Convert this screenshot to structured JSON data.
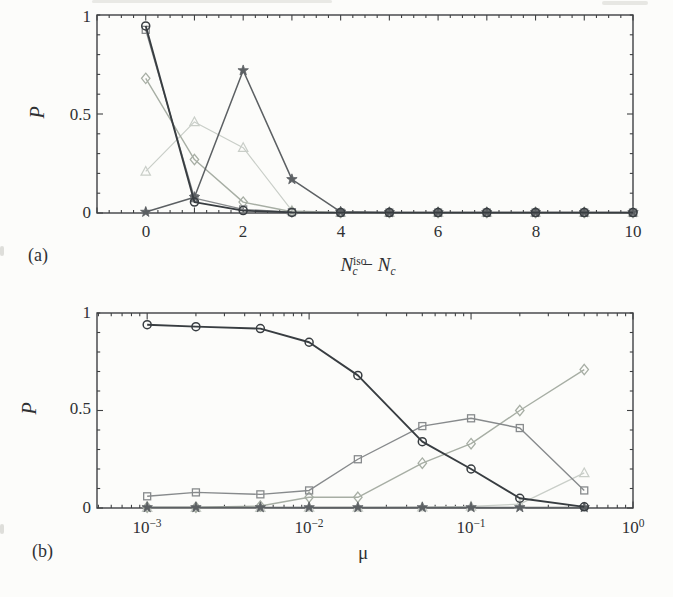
{
  "figure": {
    "background": "#fcfcfa",
    "axis_color": "#3f4143",
    "text_color": "#2f3133",
    "panels": [
      {
        "label": "(a)",
        "ylabel": "P",
        "yticks": [
          "1",
          "0.5",
          "0"
        ],
        "xticks": [
          "0",
          "2",
          "4",
          "6",
          "8",
          "10"
        ],
        "xlabel_parts": {
          "N1": "N",
          "sup": "iso",
          "sub1": "c",
          "minus": "−",
          "N2": "N",
          "sub2": "c"
        }
      },
      {
        "label": "(b)",
        "ylabel": "P",
        "yticks": [
          "1",
          "0.5",
          "0"
        ],
        "xticks": [
          {
            "base": "10",
            "exp": "−3"
          },
          {
            "base": "10",
            "exp": "−2"
          },
          {
            "base": "10",
            "exp": "−1"
          },
          {
            "base": "10",
            "exp": "0"
          }
        ],
        "xlabel": "μ"
      }
    ]
  },
  "chart_data": [
    {
      "type": "line",
      "panel": "a",
      "xlabel": "N_c^iso - N_c",
      "ylabel": "P",
      "xscale": "linear",
      "xlim": [
        -1,
        10
      ],
      "ylim": [
        0,
        1
      ],
      "x": [
        0,
        1,
        2,
        3,
        4,
        5,
        6,
        7,
        8,
        9,
        10
      ],
      "series": [
        {
          "name": "triangle-series",
          "marker": "triangle",
          "color": "#c9cec8",
          "linewidth": 1.2,
          "values": [
            0.21,
            0.46,
            0.33,
            0.012,
            0.002,
            0.002,
            0.002,
            0.002,
            0.002,
            0.002,
            0.002
          ]
        },
        {
          "name": "diamond-series",
          "marker": "diamond",
          "color": "#a7aea4",
          "linewidth": 1.4,
          "values": [
            0.68,
            0.27,
            0.055,
            0.006,
            0.002,
            0.002,
            0.002,
            0.002,
            0.002,
            0.002,
            0.002
          ]
        },
        {
          "name": "square-series",
          "marker": "square",
          "color": "#878a8c",
          "linewidth": 1.4,
          "values": [
            0.925,
            0.075,
            0.018,
            0.004,
            0.002,
            0.002,
            0.002,
            0.002,
            0.002,
            0.002,
            0.002
          ]
        },
        {
          "name": "star-series",
          "marker": "star",
          "color": "#5c6063",
          "linewidth": 1.5,
          "values": [
            0.005,
            0.08,
            0.72,
            0.17,
            0.006,
            0.003,
            0.003,
            0.003,
            0.003,
            0.003,
            0.003
          ]
        },
        {
          "name": "circle-series",
          "marker": "circle",
          "color": "#383d41",
          "linewidth": 1.9,
          "values": [
            0.945,
            0.055,
            0.012,
            0.003,
            0.002,
            0.002,
            0.002,
            0.002,
            0.002,
            0.002,
            0.002
          ]
        }
      ]
    },
    {
      "type": "line",
      "panel": "b",
      "xlabel": "mu",
      "ylabel": "P",
      "xscale": "log",
      "xlim": [
        0.00049,
        1
      ],
      "ylim": [
        0,
        1
      ],
      "x": [
        0.001,
        0.002,
        0.005,
        0.01,
        0.02,
        0.05,
        0.1,
        0.2,
        0.5
      ],
      "series": [
        {
          "name": "triangle-series",
          "marker": "triangle",
          "color": "#c9cec8",
          "linewidth": 1.2,
          "values": [
            0.002,
            0.002,
            0.002,
            0.003,
            0.003,
            0.004,
            0.008,
            0.02,
            0.18
          ]
        },
        {
          "name": "diamond-series",
          "marker": "diamond",
          "color": "#a7aea4",
          "linewidth": 1.4,
          "values": [
            0.004,
            0.004,
            0.01,
            0.055,
            0.055,
            0.23,
            0.33,
            0.5,
            0.71
          ]
        },
        {
          "name": "square-series",
          "marker": "square",
          "color": "#878a8c",
          "linewidth": 1.4,
          "values": [
            0.06,
            0.08,
            0.07,
            0.09,
            0.25,
            0.42,
            0.46,
            0.41,
            0.09
          ]
        },
        {
          "name": "star-series",
          "marker": "star",
          "color": "#5c6063",
          "linewidth": 1.5,
          "values": [
            0.003,
            0.003,
            0.003,
            0.003,
            0.003,
            0.003,
            0.003,
            0.003,
            0.003
          ]
        },
        {
          "name": "circle-series",
          "marker": "circle",
          "color": "#383d41",
          "linewidth": 1.9,
          "values": [
            0.94,
            0.93,
            0.92,
            0.85,
            0.68,
            0.34,
            0.2,
            0.05,
            0.006
          ]
        }
      ]
    }
  ]
}
